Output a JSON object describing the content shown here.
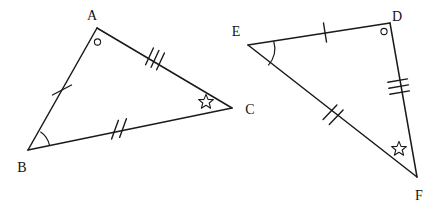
{
  "figure": {
    "background_color": "#ffffff",
    "stroke_color": "#1a1a1a",
    "width": 447,
    "height": 206
  },
  "triangles": [
    {
      "name": "triangle-abc",
      "vertices": [
        {
          "label": "A",
          "x": 97,
          "y": 28,
          "label_x": 92,
          "label_y": 20
        },
        {
          "label": "B",
          "x": 28,
          "y": 150,
          "label_x": 22,
          "label_y": 170
        },
        {
          "label": "C",
          "x": 232,
          "y": 108,
          "label_x": 249,
          "label_y": 114
        }
      ],
      "sides": [
        {
          "name": "side-ab",
          "from": "A",
          "to": "B",
          "ticks": 1,
          "tick_x": 62,
          "tick_y": 90
        },
        {
          "name": "side-ac",
          "from": "A",
          "to": "C",
          "ticks": 3,
          "tick_x": 154,
          "tick_y": 58
        },
        {
          "name": "side-bc",
          "from": "B",
          "to": "C",
          "ticks": 2,
          "tick_x": 119,
          "tick_y": 130
        }
      ],
      "angle_marks": [
        {
          "name": "angle-mark-a",
          "type": "small-circle",
          "x": 97,
          "y": 42,
          "r": 3
        },
        {
          "name": "angle-mark-b",
          "type": "arc",
          "x": 28,
          "y": 150,
          "r": 22
        },
        {
          "name": "angle-mark-c",
          "type": "star",
          "x": 206,
          "y": 101,
          "r": 7
        }
      ]
    },
    {
      "name": "triangle-edf",
      "vertices": [
        {
          "label": "E",
          "x": 248,
          "y": 45,
          "label_x": 235,
          "label_y": 35
        },
        {
          "label": "D",
          "x": 390,
          "y": 23,
          "label_x": 392,
          "label_y": 20
        },
        {
          "label": "F",
          "x": 417,
          "y": 177,
          "label_x": 417,
          "label_y": 199
        }
      ],
      "sides": [
        {
          "name": "side-ed",
          "from": "E",
          "to": "D",
          "ticks": 1,
          "tick_x": 325,
          "tick_y": 33
        },
        {
          "name": "side-df",
          "from": "D",
          "to": "F",
          "ticks": 3,
          "tick_x": 398,
          "tick_y": 88
        },
        {
          "name": "side-ef",
          "from": "E",
          "to": "F",
          "ticks": 2,
          "tick_x": 333,
          "tick_y": 114
        }
      ],
      "angle_marks": [
        {
          "name": "angle-mark-d",
          "type": "small-circle",
          "x": 384,
          "y": 31,
          "r": 3
        },
        {
          "name": "angle-mark-e",
          "type": "arc",
          "x": 248,
          "y": 45,
          "r": 26
        },
        {
          "name": "angle-mark-f",
          "type": "star",
          "x": 399,
          "y": 148,
          "r": 7
        }
      ]
    }
  ],
  "labels": {
    "A": "A",
    "B": "B",
    "C": "C",
    "D": "D",
    "E": "E",
    "F": "F"
  }
}
